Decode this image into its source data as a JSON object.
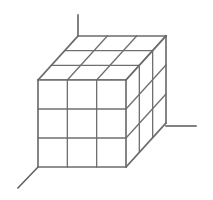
{
  "figure": {
    "kind": "line-drawing",
    "background_color": "#ffffff",
    "line_color": "#6b6b6b",
    "canvas": {
      "width": 213,
      "height": 200
    }
  },
  "geometry": {
    "subdivisions": {
      "x": 3,
      "y": 3,
      "z": 3
    },
    "front_face": {
      "top_left": [
        38,
        80
      ],
      "top_right": [
        126,
        80
      ],
      "bottom_right": [
        126,
        167
      ],
      "bottom_left": [
        38,
        167
      ]
    },
    "depth_offset": [
      40,
      -44
    ],
    "back_face": {
      "top_left": [
        78,
        36
      ],
      "top_right": [
        166,
        36
      ],
      "bottom_right": [
        166,
        123
      ],
      "bottom_left": [
        78,
        123
      ]
    }
  },
  "axes": {
    "vertical": {
      "name": "vertical-axis-line",
      "from": [
        78,
        15
      ],
      "to": [
        78,
        36
      ]
    },
    "horizontal": {
      "name": "horizontal-axis-line",
      "from": [
        166,
        126
      ],
      "to": [
        196,
        126
      ]
    },
    "diagonal": {
      "name": "diagonal-axis-line",
      "from": [
        38,
        167
      ],
      "to": [
        18,
        188
      ]
    }
  },
  "labels": {
    "vertical_axis": "",
    "horizontal_axis": "",
    "diagonal_axis": ""
  }
}
